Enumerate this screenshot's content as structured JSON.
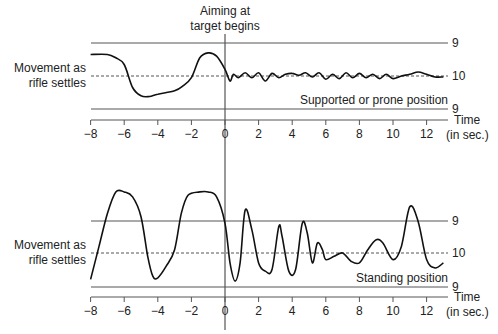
{
  "annotation_top": [
    "Aiming at",
    "target begins"
  ],
  "chart_data": [
    {
      "type": "line",
      "title": "Supported or prone position",
      "xlabel": "Time (in sec.)",
      "ylabel": "Movement as rifle settles",
      "xlim": [
        -8,
        13
      ],
      "x_ticks": [
        -8,
        -6,
        -4,
        -2,
        0,
        2,
        4,
        6,
        8,
        10,
        12
      ],
      "reference_lines": [
        {
          "label": "9",
          "position": "upper"
        },
        {
          "label": "10",
          "position": "center",
          "style": "dashed"
        },
        {
          "label": "9",
          "position": "lower"
        }
      ],
      "series": [
        {
          "name": "rifle movement (supported)",
          "x": [
            -8,
            -7,
            -6.5,
            -6,
            -5.5,
            -5,
            -4.5,
            -4,
            -3,
            -2.5,
            -2,
            -1.5,
            -1,
            -0.5,
            0,
            0.3,
            0.5,
            0.8,
            1.2,
            1.6,
            2,
            2.4,
            2.8,
            3.2,
            3.6,
            4,
            4.4,
            4.8,
            5.2,
            5.6,
            6,
            6.4,
            6.8,
            7.2,
            7.6,
            8,
            8.4,
            8.8,
            9.2,
            9.6,
            10,
            10.5,
            11,
            11.5,
            12,
            12.5,
            13
          ],
          "y": [
            0.65,
            0.65,
            0.55,
            0.35,
            -0.35,
            -0.6,
            -0.62,
            -0.55,
            -0.45,
            -0.3,
            -0.05,
            0.55,
            0.7,
            0.6,
            0.2,
            -0.15,
            0.05,
            -0.05,
            0.1,
            -0.05,
            0.1,
            -0.15,
            0.08,
            -0.05,
            0.05,
            0.08,
            0.02,
            0.1,
            -0.03,
            0.1,
            -0.1,
            0.05,
            -0.08,
            0.1,
            -0.05,
            0.08,
            -0.05,
            0.05,
            -0.08,
            0.05,
            -0.08,
            0,
            0.05,
            0.12,
            0.05,
            -0.03,
            -0.03
          ]
        }
      ]
    },
    {
      "type": "line",
      "title": "Standing position",
      "xlabel": "Time (in sec.)",
      "ylabel": "Movement as rifle settles",
      "xlim": [
        -8,
        13
      ],
      "x_ticks": [
        -8,
        -6,
        -4,
        -2,
        0,
        2,
        4,
        6,
        8,
        10,
        12
      ],
      "reference_lines": [
        {
          "label": "9",
          "position": "upper"
        },
        {
          "label": "10",
          "position": "center",
          "style": "dashed"
        },
        {
          "label": "9",
          "position": "lower"
        }
      ],
      "series": [
        {
          "name": "rifle movement (standing)",
          "x": [
            -8,
            -7.5,
            -7,
            -6.5,
            -6,
            -5.5,
            -5,
            -4.6,
            -4.3,
            -4,
            -3.5,
            -3,
            -2.6,
            -2.2,
            -1.5,
            -1,
            -0.5,
            0,
            0.3,
            0.6,
            0.9,
            1.2,
            1.6,
            2,
            2.4,
            2.8,
            3.2,
            3.4,
            3.8,
            4.2,
            4.6,
            4.9,
            5.2,
            5.5,
            5.8,
            6,
            6.5,
            7,
            7.5,
            8,
            8.5,
            9,
            9.4,
            10,
            10.5,
            11,
            11.5,
            12,
            12.5,
            13
          ],
          "y": [
            -0.8,
            0.2,
            1.2,
            1.85,
            1.85,
            1.7,
            1.1,
            -0.1,
            -0.7,
            -0.75,
            -0.4,
            0.1,
            1.2,
            1.75,
            1.85,
            1.85,
            1.7,
            0.9,
            -0.3,
            -0.85,
            -0.3,
            1.3,
            0.7,
            -0.3,
            -0.55,
            -0.5,
            0.8,
            0.5,
            -0.55,
            -0.5,
            0.9,
            0.6,
            -0.3,
            0.3,
            0.1,
            -0.2,
            -0.1,
            0,
            -0.25,
            -0.3,
            0.1,
            0.4,
            0.3,
            -0.2,
            0.2,
            1.4,
            0.95,
            -0.2,
            -0.45,
            -0.3
          ]
        }
      ]
    }
  ],
  "panels": [
    {
      "ylabel": [
        "Movement as",
        "rifle settles"
      ],
      "position_label": "Supported or prone position",
      "ref_labels": {
        "upper": "9",
        "center": "10",
        "lower": "9"
      },
      "time_label": [
        "Time",
        "(in sec.)"
      ],
      "tick_labels": [
        "−8",
        "−6",
        "−4",
        "−2",
        "0",
        "2",
        "4",
        "6",
        "8",
        "10",
        "12"
      ]
    },
    {
      "ylabel": [
        "Movement as",
        "rifle settles"
      ],
      "position_label": "Standing position",
      "ref_labels": {
        "upper": "9",
        "center": "10",
        "lower": "9"
      },
      "time_label": [
        "Time",
        "(in sec.)"
      ],
      "tick_labels": [
        "−8",
        "−6",
        "−4",
        "−2",
        "0",
        "2",
        "4",
        "6",
        "8",
        "10",
        "12"
      ]
    }
  ]
}
